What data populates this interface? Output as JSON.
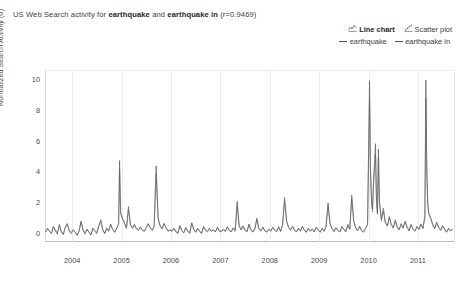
{
  "title": {
    "prefix": "US Web Search activity for ",
    "term1": "earthquake",
    "conj": " and ",
    "term2": "earthquake in",
    "suffix": " (r=0.9469)"
  },
  "chart_types": [
    {
      "label": "Line chart",
      "icon": "line-chart-icon",
      "active": true
    },
    {
      "label": "Scatter plot",
      "icon": "scatter-plot-icon",
      "active": false
    }
  ],
  "legend": {
    "position": "top-right",
    "entries": [
      {
        "label": "earthquake",
        "color": "#5a5a5a"
      },
      {
        "label": "earthquake in",
        "color": "#6e6e6e"
      }
    ]
  },
  "chart_data": {
    "type": "line",
    "title": "US Web Search activity for earthquake and earthquake in (r=0.9469)",
    "xlabel": "",
    "ylabel": "Normalized Search Activity (σ)",
    "ylim": [
      -0.6,
      10.6
    ],
    "yticks": [
      0,
      2,
      4,
      6,
      8,
      10
    ],
    "xlim": [
      2003.45,
      2011.75
    ],
    "xticks": [
      2004,
      2005,
      2006,
      2007,
      2008,
      2009,
      2010,
      2011
    ],
    "xticklabels": [
      "2004",
      "2005",
      "2006",
      "2007",
      "2008",
      "2009",
      "2010",
      "2011"
    ],
    "grid": "vertical-only",
    "correlation": 0.9469,
    "series": [
      {
        "name": "earthquake",
        "color": "#5a5a5a",
        "x": [
          2003.46,
          2003.5,
          2003.54,
          2003.58,
          2003.62,
          2003.66,
          2003.7,
          2003.74,
          2003.78,
          2003.82,
          2003.86,
          2003.9,
          2003.94,
          2003.98,
          2004.02,
          2004.06,
          2004.1,
          2004.14,
          2004.18,
          2004.22,
          2004.26,
          2004.3,
          2004.34,
          2004.38,
          2004.42,
          2004.46,
          2004.5,
          2004.54,
          2004.58,
          2004.62,
          2004.66,
          2004.7,
          2004.74,
          2004.78,
          2004.82,
          2004.86,
          2004.9,
          2004.94,
          2004.96,
          2004.98,
          2005.02,
          2005.06,
          2005.1,
          2005.14,
          2005.18,
          2005.22,
          2005.26,
          2005.3,
          2005.34,
          2005.38,
          2005.42,
          2005.46,
          2005.5,
          2005.54,
          2005.58,
          2005.62,
          2005.66,
          2005.7,
          2005.74,
          2005.78,
          2005.82,
          2005.86,
          2005.9,
          2005.94,
          2005.98,
          2006.02,
          2006.06,
          2006.1,
          2006.14,
          2006.18,
          2006.22,
          2006.26,
          2006.3,
          2006.34,
          2006.38,
          2006.42,
          2006.46,
          2006.5,
          2006.54,
          2006.58,
          2006.62,
          2006.66,
          2006.7,
          2006.74,
          2006.78,
          2006.82,
          2006.86,
          2006.9,
          2006.94,
          2006.98,
          2007.02,
          2007.06,
          2007.1,
          2007.14,
          2007.18,
          2007.22,
          2007.26,
          2007.3,
          2007.34,
          2007.38,
          2007.42,
          2007.46,
          2007.5,
          2007.54,
          2007.58,
          2007.62,
          2007.66,
          2007.7,
          2007.74,
          2007.78,
          2007.82,
          2007.86,
          2007.9,
          2007.94,
          2007.98,
          2008.02,
          2008.06,
          2008.1,
          2008.14,
          2008.18,
          2008.22,
          2008.26,
          2008.3,
          2008.34,
          2008.38,
          2008.42,
          2008.46,
          2008.5,
          2008.54,
          2008.58,
          2008.62,
          2008.66,
          2008.7,
          2008.74,
          2008.78,
          2008.82,
          2008.86,
          2008.9,
          2008.94,
          2008.98,
          2009.02,
          2009.06,
          2009.1,
          2009.14,
          2009.18,
          2009.22,
          2009.26,
          2009.3,
          2009.34,
          2009.38,
          2009.42,
          2009.46,
          2009.5,
          2009.54,
          2009.58,
          2009.62,
          2009.66,
          2009.7,
          2009.74,
          2009.78,
          2009.82,
          2009.86,
          2009.9,
          2009.94,
          2009.98,
          2010.02,
          2010.04,
          2010.06,
          2010.08,
          2010.1,
          2010.14,
          2010.16,
          2010.18,
          2010.2,
          2010.22,
          2010.26,
          2010.3,
          2010.34,
          2010.38,
          2010.42,
          2010.46,
          2010.5,
          2010.54,
          2010.58,
          2010.62,
          2010.66,
          2010.7,
          2010.74,
          2010.78,
          2010.82,
          2010.86,
          2010.9,
          2010.94,
          2010.98,
          2011.02,
          2011.06,
          2011.1,
          2011.14,
          2011.16,
          2011.18,
          2011.2,
          2011.22,
          2011.26,
          2011.3,
          2011.34,
          2011.38,
          2011.42,
          2011.46,
          2011.5,
          2011.54,
          2011.58,
          2011.62,
          2011.66,
          2011.7
        ],
        "y": [
          0.05,
          0.3,
          0.1,
          -0.05,
          0.4,
          0.12,
          -0.1,
          0.55,
          0.08,
          -0.12,
          0.35,
          0.6,
          0.1,
          -0.05,
          0.2,
          0.05,
          -0.18,
          0.1,
          0.75,
          0.15,
          -0.1,
          0.25,
          0.05,
          -0.15,
          0.3,
          0.1,
          -0.05,
          0.45,
          0.85,
          0.2,
          -0.05,
          0.3,
          0.1,
          0.55,
          0.2,
          0.05,
          0.3,
          0.6,
          4.7,
          1.35,
          0.95,
          0.6,
          0.35,
          1.7,
          0.55,
          0.3,
          0.55,
          0.25,
          0.15,
          0.4,
          0.2,
          0.1,
          0.35,
          0.6,
          0.3,
          0.15,
          0.45,
          4.35,
          1.0,
          0.45,
          0.25,
          0.6,
          0.3,
          0.12,
          0.2,
          0.1,
          0.3,
          0.05,
          -0.05,
          0.45,
          0.15,
          0.0,
          0.35,
          0.1,
          -0.05,
          0.65,
          0.2,
          0.05,
          0.3,
          0.1,
          -0.05,
          0.4,
          0.15,
          0.05,
          0.3,
          0.1,
          0.2,
          0.05,
          0.35,
          0.1,
          0.05,
          0.25,
          0.1,
          0.4,
          0.15,
          0.05,
          0.3,
          0.1,
          2.05,
          0.5,
          0.2,
          0.45,
          0.15,
          0.05,
          0.55,
          0.2,
          0.05,
          0.3,
          0.95,
          0.25,
          0.1,
          0.35,
          0.15,
          0.05,
          0.25,
          0.1,
          0.35,
          0.15,
          0.05,
          0.4,
          0.1,
          0.55,
          2.3,
          0.8,
          0.35,
          0.15,
          0.45,
          0.2,
          0.05,
          0.3,
          0.1,
          0.4,
          0.15,
          0.05,
          0.3,
          0.1,
          0.25,
          0.05,
          0.35,
          0.15,
          0.05,
          0.3,
          0.1,
          0.45,
          1.95,
          0.6,
          0.25,
          0.1,
          0.35,
          0.15,
          0.05,
          0.4,
          0.2,
          0.05,
          0.55,
          0.25,
          2.45,
          0.8,
          0.3,
          0.12,
          0.4,
          0.15,
          0.05,
          0.3,
          0.55,
          9.9,
          4.2,
          2.1,
          1.55,
          3.4,
          5.8,
          2.2,
          1.3,
          5.45,
          2.1,
          0.9,
          1.6,
          0.7,
          0.45,
          1.05,
          0.55,
          0.3,
          0.85,
          0.4,
          0.2,
          0.6,
          0.3,
          0.75,
          0.35,
          0.15,
          0.55,
          0.25,
          0.1,
          0.4,
          0.2,
          0.55,
          0.3,
          1.1,
          9.95,
          4.1,
          1.85,
          1.3,
          0.95,
          0.55,
          0.3,
          0.7,
          0.35,
          0.15,
          0.45,
          0.2,
          0.05,
          0.3,
          0.12,
          0.25
        ]
      },
      {
        "name": "earthquake in",
        "color": "#6e6e6e",
        "note": "nearly-identical trace, slightly damped peaks (r=0.9469)",
        "scale": 0.88,
        "offset": 0.03
      }
    ],
    "annotations": [
      {
        "x": 2004.96,
        "y": 4.7,
        "note": "Dec 2004 Indian Ocean earthquake"
      },
      {
        "x": 2005.7,
        "y": 4.35,
        "note": "Oct 2005 Kashmir earthquake"
      },
      {
        "x": 2008.3,
        "y": 2.3,
        "note": "May 2008 Sichuan earthquake"
      },
      {
        "x": 2009.5,
        "y": 2.45,
        "note": "Sep 2009 Samoa/Sumatra earthquakes"
      },
      {
        "x": 2010.02,
        "y": 9.9,
        "note": "Jan 2010 Haiti earthquake"
      },
      {
        "x": 2010.14,
        "y": 5.8,
        "note": "Feb 2010 Chile earthquake"
      },
      {
        "x": 2011.16,
        "y": 9.95,
        "note": "Mar 2011 Tohoku Japan earthquake"
      }
    ]
  }
}
